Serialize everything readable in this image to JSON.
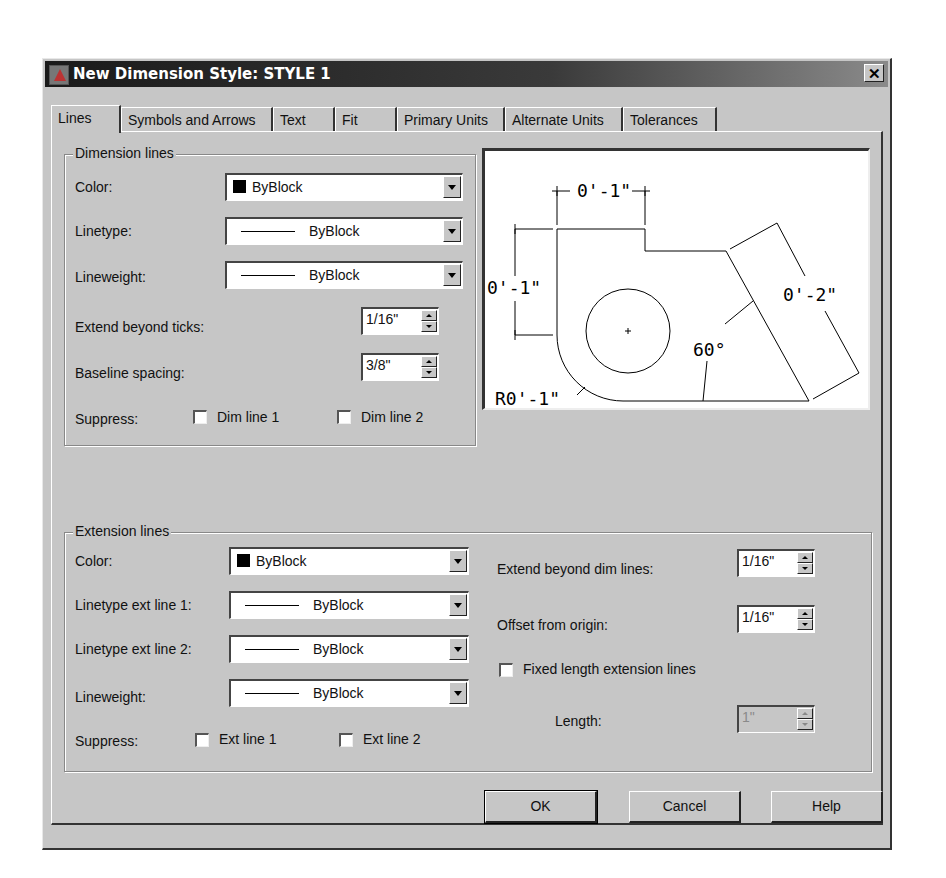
{
  "window": {
    "title": "New Dimension Style: STYLE 1",
    "close_label": "✕"
  },
  "tabs": [
    {
      "label": "Lines",
      "active": true
    },
    {
      "label": "Symbols and Arrows",
      "active": false
    },
    {
      "label": "Text",
      "active": false
    },
    {
      "label": "Fit",
      "active": false
    },
    {
      "label": "Primary Units",
      "active": false
    },
    {
      "label": "Alternate Units",
      "active": false
    },
    {
      "label": "Tolerances",
      "active": false
    }
  ],
  "dimension_lines": {
    "group_label": "Dimension lines",
    "color": {
      "label": "Color:",
      "value": "ByBlock",
      "swatch": "#000000"
    },
    "linetype": {
      "label": "Linetype:",
      "value": "ByBlock"
    },
    "lineweight": {
      "label": "Lineweight:",
      "value": "ByBlock"
    },
    "extend_beyond_ticks": {
      "label": "Extend beyond ticks:",
      "value": "1/16\""
    },
    "baseline_spacing": {
      "label": "Baseline spacing:",
      "value": "3/8\""
    },
    "suppress": {
      "label": "Suppress:",
      "dim_line_1": {
        "label": "Dim line 1",
        "checked": false
      },
      "dim_line_2": {
        "label": "Dim line 2",
        "checked": false
      }
    }
  },
  "preview": {
    "labels": {
      "top_dim": "0'-1\"",
      "left_dim": "0'-1\"",
      "right_dim": "0'-2\"",
      "angle": "60°",
      "radius": "R0'-1\""
    }
  },
  "extension_lines": {
    "group_label": "Extension lines",
    "color": {
      "label": "Color:",
      "value": "ByBlock",
      "swatch": "#000000"
    },
    "linetype_ext_line_1": {
      "label": "Linetype ext line 1:",
      "value": "ByBlock"
    },
    "linetype_ext_line_2": {
      "label": "Linetype ext line 2:",
      "value": "ByBlock"
    },
    "lineweight": {
      "label": "Lineweight:",
      "value": "ByBlock"
    },
    "suppress": {
      "label": "Suppress:",
      "ext_line_1": {
        "label": "Ext line 1",
        "checked": false
      },
      "ext_line_2": {
        "label": "Ext line 2",
        "checked": false
      }
    },
    "extend_beyond_dim_lines": {
      "label": "Extend beyond dim lines:",
      "value": "1/16\""
    },
    "offset_from_origin": {
      "label": "Offset from origin:",
      "value": "1/16\""
    },
    "fixed_length": {
      "label": "Fixed length extension lines",
      "checked": false
    },
    "length": {
      "label": "Length:",
      "value": "1\"",
      "disabled": true
    }
  },
  "buttons": {
    "ok": "OK",
    "cancel": "Cancel",
    "help": "Help"
  }
}
